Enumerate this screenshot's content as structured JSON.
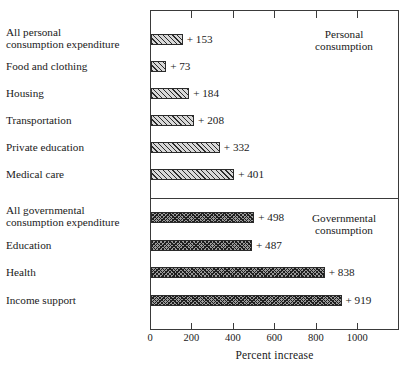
{
  "chart_data": {
    "type": "bar",
    "orientation": "horizontal",
    "title": "",
    "xlabel": "Percent increase",
    "ylabel": "",
    "xlim": [
      0,
      1200
    ],
    "xticks": [
      0,
      200,
      400,
      600,
      800,
      1000
    ],
    "xtick_labels": [
      "0",
      "200",
      "400",
      "600",
      "800",
      "1000"
    ],
    "grid": false,
    "legend": "none",
    "panels": [
      {
        "name": "Personal consumption",
        "caption_line1": "Personal",
        "caption_line2": "consumption",
        "pattern": "diagonal-hatch",
        "categories": [
          "All personal consumption expenditure",
          "Food and clothing",
          "Housing",
          "Transportation",
          "Private education",
          "Medical care"
        ],
        "values": [
          153,
          73,
          184,
          208,
          332,
          401
        ],
        "value_labels": [
          "+ 153",
          "+ 73",
          "+ 184",
          "+ 208",
          "+ 332",
          "+ 401"
        ],
        "category_lines": [
          [
            "All personal",
            "consumption expenditure"
          ],
          [
            "Food and clothing",
            ""
          ],
          [
            "Housing",
            ""
          ],
          [
            "Transportation",
            ""
          ],
          [
            "Private education",
            ""
          ],
          [
            "Medical care",
            ""
          ]
        ]
      },
      {
        "name": "Governmental consumption",
        "caption_line1": "Governmental",
        "caption_line2": "consumption",
        "pattern": "cross-hatch",
        "categories": [
          "All governmental consumption expenditure",
          "Education",
          "Health",
          "Income support"
        ],
        "values": [
          498,
          487,
          838,
          919
        ],
        "value_labels": [
          "+ 498",
          "+ 487",
          "+ 838",
          "+ 919"
        ],
        "category_lines": [
          [
            "All governmental",
            "consumption expenditure"
          ],
          [
            "Education",
            ""
          ],
          [
            "Health",
            ""
          ],
          [
            "Income support",
            ""
          ]
        ]
      }
    ]
  },
  "colors": {
    "axis": "#3a3a3a",
    "text": "#1a1a1a",
    "personal_bar_fill": "#d8d8d8",
    "government_bar_fill": "#9a9a9a",
    "hatch": "#2b2b2b",
    "background": "#ffffff"
  }
}
